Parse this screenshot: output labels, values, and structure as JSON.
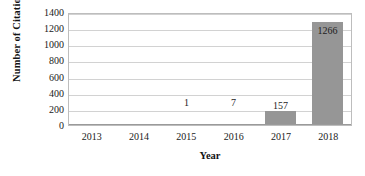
{
  "chart_data": {
    "type": "bar",
    "title": "",
    "xlabel": "Year",
    "ylabel": "Number of Citations",
    "categories": [
      "2013",
      "2014",
      "2015",
      "2016",
      "2017",
      "2018"
    ],
    "values": [
      0,
      0,
      1,
      7,
      157,
      1266
    ],
    "point_labels": [
      "",
      "",
      "1",
      "7",
      "157",
      "1266"
    ],
    "label_positions": [
      "none",
      "none",
      "above",
      "above",
      "above",
      "inside"
    ],
    "ylim": [
      0,
      1400
    ],
    "ytick_labels": [
      "1400",
      "1200",
      "1000",
      "800",
      "600",
      "400",
      "200",
      "0"
    ],
    "ytick_values": [
      1400,
      1200,
      1000,
      800,
      600,
      400,
      200,
      0
    ],
    "ystep": 200,
    "grid": true,
    "legend": false,
    "legend_position": "none",
    "bar_color": "#969696",
    "grid_color": "#d2d2d2",
    "axis_color": "#9a9a9a",
    "text_color": "#1a1a1a",
    "background_color": "#ffffff"
  }
}
